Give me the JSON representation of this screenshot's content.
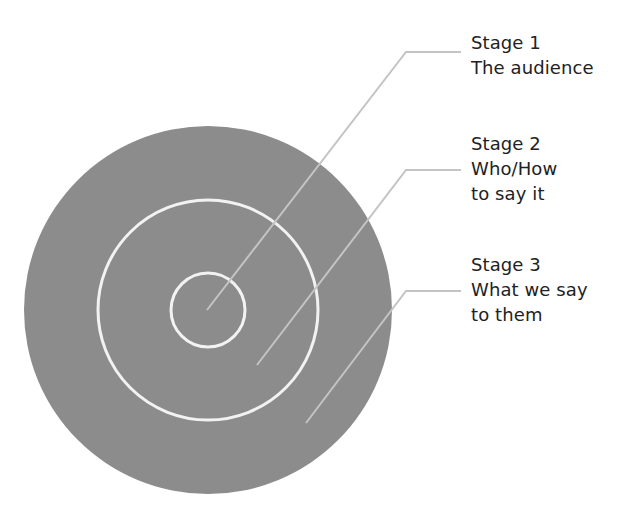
{
  "diagram": {
    "type": "concentric-circles",
    "colors": {
      "fill": "#8c8c8c",
      "ring_stroke": "#f2f2f2",
      "leader_stroke": "#c4c4c4",
      "text": "#222222",
      "background": "#ffffff"
    },
    "center": {
      "x": 208,
      "y": 310
    },
    "circles": [
      {
        "name": "outer",
        "r": 184
      },
      {
        "name": "middle",
        "r": 110
      },
      {
        "name": "inner",
        "r": 37
      }
    ],
    "stages": [
      {
        "title": "Stage 1",
        "lines": [
          "The audience"
        ],
        "leader": {
          "from": [
            207,
            310
          ],
          "elbow": [
            406,
            52
          ],
          "to": [
            461,
            52
          ]
        },
        "label_top": 30
      },
      {
        "title": "Stage 2",
        "lines": [
          "Who/How",
          "to say it"
        ],
        "leader": {
          "from": [
            257,
            365
          ],
          "elbow": [
            406,
            170
          ],
          "to": [
            461,
            170
          ]
        },
        "label_top": 131
      },
      {
        "title": "Stage 3",
        "lines": [
          "What we say",
          "to them"
        ],
        "leader": {
          "from": [
            306,
            423
          ],
          "elbow": [
            406,
            291
          ],
          "to": [
            461,
            291
          ]
        },
        "label_top": 252
      }
    ]
  }
}
